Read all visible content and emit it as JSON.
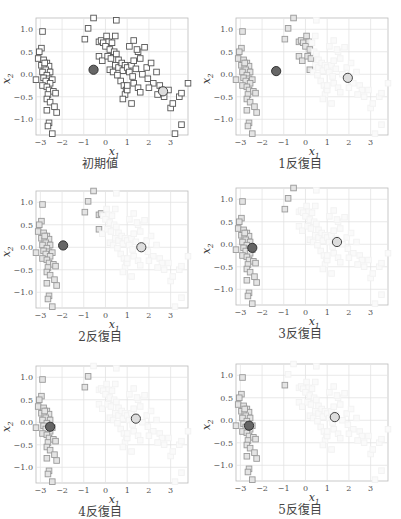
{
  "chart_data": {
    "type": "scatter",
    "xlabel": "x1",
    "ylabel": "x2",
    "xlim": [
      -3.2,
      3.8
    ],
    "ylim": [
      -1.35,
      1.25
    ],
    "xticks": [
      -3,
      -2,
      -1,
      0,
      1,
      2,
      3
    ],
    "yticks": [
      1.0,
      0.5,
      0.0,
      -0.5,
      -1.0
    ],
    "ytick_labels": [
      "1.0",
      "0.5",
      "0.0",
      "−0.5",
      "−1.0"
    ],
    "xtick_labels": [
      "−3",
      "−2",
      "−1",
      "0",
      "1",
      "2",
      "3"
    ],
    "grid": true,
    "colors": {
      "dark_centroid": "#666666",
      "light_centroid": "#dddddd",
      "dark_points": "#555555",
      "gray_points": "#999999",
      "faint_points": "#f2f2f2"
    },
    "points": [
      [
        -2.9,
        0.95
      ],
      [
        -2.95,
        0.58
      ],
      [
        -3.05,
        0.5
      ],
      [
        -3.1,
        0.35
      ],
      [
        -2.85,
        0.32
      ],
      [
        -2.7,
        0.25
      ],
      [
        -2.95,
        0.2
      ],
      [
        -2.8,
        0.15
      ],
      [
        -2.6,
        0.18
      ],
      [
        -2.75,
        0.1
      ],
      [
        -2.9,
        0.05
      ],
      [
        -2.55,
        0.05
      ],
      [
        -2.7,
        -0.02
      ],
      [
        -2.85,
        -0.08
      ],
      [
        -2.6,
        -0.1
      ],
      [
        -2.45,
        -0.12
      ],
      [
        -2.75,
        -0.15
      ],
      [
        -2.55,
        -0.2
      ],
      [
        -2.9,
        -0.25
      ],
      [
        -2.7,
        -0.28
      ],
      [
        -2.6,
        -0.35
      ],
      [
        -2.4,
        -0.38
      ],
      [
        -2.3,
        -0.42
      ],
      [
        -2.65,
        -0.45
      ],
      [
        -2.7,
        -0.55
      ],
      [
        -2.55,
        -0.62
      ],
      [
        -2.35,
        -0.72
      ],
      [
        -2.7,
        -0.8
      ],
      [
        -2.25,
        -0.85
      ],
      [
        -2.6,
        -1.08
      ],
      [
        -2.65,
        -1.15
      ],
      [
        -2.45,
        -1.32
      ],
      [
        -3.2,
        -0.12
      ],
      [
        -2.8,
        0.25
      ],
      [
        -0.55,
        1.25
      ],
      [
        -0.8,
        1.02
      ],
      [
        -0.95,
        0.78
      ],
      [
        -0.3,
        0.72
      ],
      [
        -0.2,
        0.75
      ],
      [
        -0.1,
        0.7
      ],
      [
        0.05,
        0.85
      ],
      [
        0.15,
        0.72
      ],
      [
        0.0,
        0.62
      ],
      [
        0.2,
        0.55
      ],
      [
        0.3,
        0.7
      ],
      [
        0.4,
        0.5
      ],
      [
        -0.3,
        0.4
      ],
      [
        -0.15,
        0.3
      ],
      [
        0.1,
        0.4
      ],
      [
        0.25,
        0.35
      ],
      [
        0.5,
        0.45
      ],
      [
        0.6,
        0.32
      ],
      [
        0.45,
        0.2
      ],
      [
        0.2,
        0.1
      ],
      [
        0.35,
        0.05
      ],
      [
        0.6,
        0.15
      ],
      [
        0.75,
        0.25
      ],
      [
        0.9,
        0.2
      ],
      [
        0.8,
        0.08
      ],
      [
        0.55,
        -0.02
      ],
      [
        0.7,
        -0.15
      ],
      [
        0.85,
        -0.25
      ],
      [
        0.95,
        -0.35
      ],
      [
        0.9,
        -0.45
      ],
      [
        1.0,
        0.15
      ],
      [
        1.2,
        0.2
      ],
      [
        1.1,
        0.05
      ],
      [
        1.3,
        0.3
      ],
      [
        1.4,
        0.12
      ],
      [
        1.25,
        -0.05
      ],
      [
        1.5,
        0.5
      ],
      [
        1.6,
        0.35
      ],
      [
        1.8,
        0.6
      ],
      [
        1.3,
        0.75
      ],
      [
        1.1,
        0.62
      ],
      [
        1.45,
        0.55
      ],
      [
        1.7,
        0.0
      ],
      [
        1.9,
        0.15
      ],
      [
        2.1,
        0.25
      ],
      [
        1.95,
        -0.1
      ],
      [
        2.2,
        -0.2
      ],
      [
        2.35,
        0.05
      ],
      [
        2.5,
        -0.25
      ],
      [
        2.6,
        -0.35
      ],
      [
        2.4,
        -0.45
      ],
      [
        2.7,
        -0.5
      ],
      [
        2.9,
        -0.35
      ],
      [
        3.0,
        -0.75
      ],
      [
        3.1,
        -0.65
      ],
      [
        3.4,
        -0.5
      ],
      [
        3.5,
        -0.42
      ],
      [
        3.8,
        -0.2
      ],
      [
        3.5,
        -1.12
      ],
      [
        3.2,
        -1.32
      ],
      [
        1.3,
        -0.2
      ],
      [
        1.5,
        -0.3
      ],
      [
        1.0,
        -0.35
      ],
      [
        1.2,
        -0.65
      ],
      [
        1.0,
        -0.25
      ],
      [
        0.8,
        -0.55
      ],
      [
        2.0,
        -0.3
      ],
      [
        1.6,
        -0.4
      ],
      [
        0.5,
        1.2
      ],
      [
        0.45,
        0.85
      ]
    ],
    "panels": [
      {
        "label": "初期値",
        "centroid_dark": [
          -0.55,
          0.1
        ],
        "centroid_light": [
          2.65,
          -0.38
        ],
        "mode": "init"
      },
      {
        "label": "1反復目",
        "centroid_dark": [
          -1.35,
          0.07
        ],
        "centroid_light": [
          1.95,
          -0.08
        ],
        "split_x": 0.3
      },
      {
        "label": "2反復目",
        "centroid_dark": [
          -1.95,
          0.04
        ],
        "centroid_light": [
          1.65,
          0.0
        ],
        "split_x": -0.15
      },
      {
        "label": "3反復目",
        "centroid_dark": [
          -2.45,
          -0.08
        ],
        "centroid_light": [
          1.45,
          0.05
        ],
        "split_x": -0.45
      },
      {
        "label": "4反復目",
        "centroid_dark": [
          -2.55,
          -0.1
        ],
        "centroid_light": [
          1.4,
          0.08
        ],
        "split_x": -0.7
      },
      {
        "label": "5反復目",
        "centroid_dark": [
          -2.6,
          -0.12
        ],
        "centroid_light": [
          1.35,
          0.07
        ],
        "split_x": -0.85
      }
    ]
  },
  "captions": [
    "初期値",
    "1反復目",
    "2反復目",
    "3反復目",
    "4反復目",
    "5反復目"
  ],
  "axis_labels": {
    "x": "x",
    "x_sub": "1",
    "y": "x",
    "y_sub": "2"
  }
}
